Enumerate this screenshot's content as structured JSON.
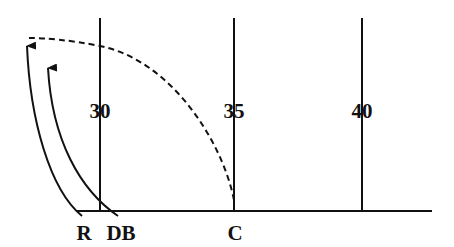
{
  "diagram": {
    "type": "football-play",
    "yard_lines": [
      {
        "label": "30",
        "x": 100
      },
      {
        "label": "35",
        "x": 234
      },
      {
        "label": "40",
        "x": 362
      }
    ],
    "players": [
      {
        "label": "R",
        "x": 84
      },
      {
        "label": "DB",
        "x": 121
      },
      {
        "label": "C",
        "x": 235
      }
    ],
    "colors": {
      "line": "#111111",
      "background": "#ffffff"
    }
  }
}
